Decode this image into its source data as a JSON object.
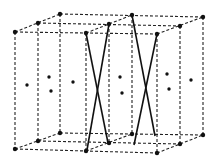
{
  "diagram": {
    "title": "",
    "colors": {
      "background": "#ffffff",
      "line": "#111111",
      "dash": "#222222"
    },
    "corners_top": [
      [
        15,
        32
      ],
      [
        38,
        23
      ],
      [
        60,
        14
      ],
      [
        86,
        33
      ],
      [
        109,
        24
      ],
      [
        132,
        15
      ],
      [
        157,
        34
      ],
      [
        180,
        26
      ],
      [
        203,
        17
      ]
    ],
    "corners_bottom": [
      [
        15,
        149
      ],
      [
        38,
        141
      ],
      [
        60,
        133
      ],
      [
        86,
        151
      ],
      [
        109,
        143
      ],
      [
        132,
        134
      ],
      [
        157,
        153
      ],
      [
        180,
        144
      ],
      [
        203,
        135
      ]
    ],
    "interior_dots": [
      [
        27,
        85
      ],
      [
        49,
        77
      ],
      [
        51,
        91
      ],
      [
        73,
        82
      ],
      [
        120,
        77
      ],
      [
        122,
        93
      ],
      [
        167,
        74
      ],
      [
        169,
        89
      ],
      [
        191,
        80
      ]
    ],
    "solid_lines": [
      [
        [
          86,
          33
        ],
        [
          108,
          143
        ]
      ],
      [
        [
          109,
          24
        ],
        [
          87,
          150
        ]
      ],
      [
        [
          132,
          15
        ],
        [
          155,
          136
        ]
      ],
      [
        [
          157,
          34
        ],
        [
          134,
          145
        ]
      ]
    ]
  }
}
